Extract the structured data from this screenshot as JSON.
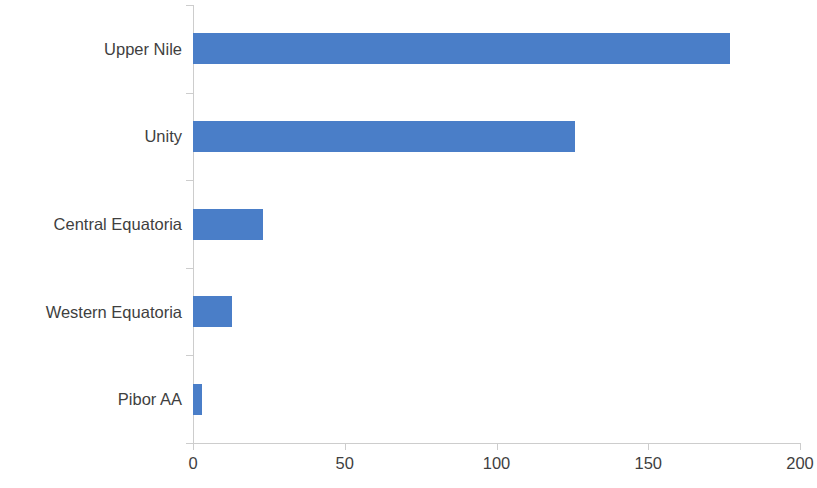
{
  "chart_data": {
    "type": "bar",
    "orientation": "horizontal",
    "title": "",
    "subtitle": "",
    "xlabel": "",
    "ylabel": "",
    "categories": [
      "Upper Nile",
      "Unity",
      "Central Equatoria",
      "Western Equatoria",
      "Pibor AA"
    ],
    "values": [
      177,
      126,
      23,
      13,
      3
    ],
    "series": [
      {
        "name": "",
        "values": [
          177,
          126,
          23,
          13,
          3
        ]
      }
    ],
    "xlim": [
      0,
      200
    ],
    "xticks": [
      0,
      50,
      100,
      150,
      200
    ],
    "xtick_labels": [
      "0",
      "50",
      "100",
      "150",
      "200"
    ],
    "grid": false,
    "legend": false,
    "legend_position": "none",
    "bar_color": "#4a7ec8",
    "axis_color": "#cdcdcd",
    "text_color": "#3f3f3f",
    "background_color": "#ffffff",
    "annotations": []
  }
}
